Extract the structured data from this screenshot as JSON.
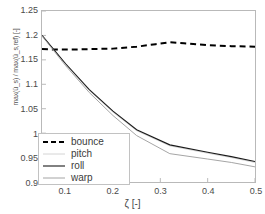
{
  "chart_data": {
    "type": "line",
    "title": "",
    "xlabel": "ζ [-]",
    "ylabel": "max(ü_s) / max(ü_s,ref) [-]",
    "xlim": [
      0.05,
      0.5
    ],
    "ylim": [
      0.9,
      1.25
    ],
    "xticks": [
      "0.1",
      "0.2",
      "0.3",
      "0.4",
      "0.5"
    ],
    "xtick_values": [
      0.1,
      0.2,
      0.3,
      0.4,
      0.5
    ],
    "yticks": [
      "0.9",
      "0.95",
      "1",
      "1.05",
      "1.1",
      "1.15",
      "1.2",
      "1.25"
    ],
    "ytick_values": [
      0.9,
      0.95,
      1.0,
      1.05,
      1.1,
      1.15,
      1.2,
      1.25
    ],
    "grid": false,
    "legend_position": "lower left",
    "series": [
      {
        "name": "bounce",
        "style": "dashed",
        "color": "#000000",
        "width": 2.0,
        "x": [
          0.05,
          0.08,
          0.11,
          0.15,
          0.2,
          0.25,
          0.29,
          0.32,
          0.35,
          0.4,
          0.45,
          0.5
        ],
        "y": [
          1.172,
          1.171,
          1.171,
          1.172,
          1.173,
          1.177,
          1.182,
          1.186,
          1.184,
          1.18,
          1.178,
          1.177
        ]
      },
      {
        "name": "pitch",
        "style": "solid",
        "color": "#cfcfcf",
        "width": 0.9,
        "x": [
          0.05,
          0.1,
          0.15,
          0.2,
          0.25,
          0.32,
          0.4,
          0.45,
          0.5
        ],
        "y": [
          1.2,
          1.141,
          1.087,
          1.043,
          1.005,
          0.974,
          0.959,
          0.95,
          0.94
        ]
      },
      {
        "name": "roll",
        "style": "solid",
        "color": "#1a1a1a",
        "width": 1.1,
        "x": [
          0.05,
          0.1,
          0.15,
          0.2,
          0.25,
          0.32,
          0.4,
          0.45,
          0.5
        ],
        "y": [
          1.2,
          1.142,
          1.089,
          1.045,
          1.007,
          0.976,
          0.961,
          0.952,
          0.942
        ]
      },
      {
        "name": "warp",
        "style": "solid",
        "color": "#9a9a9a",
        "width": 0.9,
        "x": [
          0.05,
          0.1,
          0.15,
          0.2,
          0.25,
          0.32,
          0.4,
          0.45,
          0.5
        ],
        "y": [
          1.199,
          1.138,
          1.083,
          1.036,
          0.995,
          0.958,
          0.947,
          0.94,
          0.931
        ]
      }
    ]
  },
  "legend": {
    "items": [
      {
        "label": "bounce"
      },
      {
        "label": "pitch"
      },
      {
        "label": "roll"
      },
      {
        "label": "warp"
      }
    ]
  }
}
